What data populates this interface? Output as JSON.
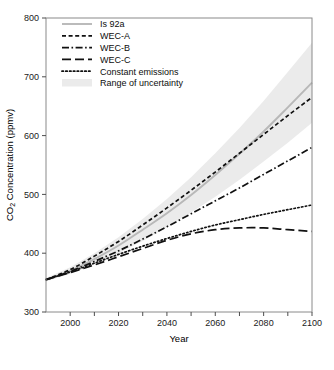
{
  "chart_data": {
    "type": "line",
    "title": "",
    "xlabel": "Year",
    "ylabel": "CO2 Concentration (ppmv)",
    "ylabel_prefix": "CO",
    "ylabel_sub": "2",
    "ylabel_suffix": " Concentration (ppmv)",
    "xlim": [
      1990,
      2100
    ],
    "ylim": [
      300,
      800
    ],
    "xticks": [
      2000,
      2010,
      2020,
      2030,
      2040,
      2050,
      2060,
      2070,
      2080,
      2090,
      2100
    ],
    "xtick_labels": [
      "2000",
      "",
      "2020",
      "",
      "2040",
      "",
      "2060",
      "",
      "2080",
      "",
      "2100"
    ],
    "yticks": [
      300,
      400,
      500,
      600,
      700,
      800
    ],
    "ytick_labels": [
      "300",
      "400",
      "500",
      "600",
      "700",
      "800"
    ],
    "grid": false,
    "legend_position": "top-left",
    "x": [
      1990,
      2000,
      2010,
      2020,
      2030,
      2040,
      2050,
      2060,
      2070,
      2080,
      2090,
      2100
    ],
    "series": [
      {
        "name": "Is 92a",
        "style": "solid",
        "color": "#b8b8b8",
        "values": [
          355,
          370,
          390,
          413,
          440,
          468,
          499,
          533,
          569,
          607,
          648,
          690
        ]
      },
      {
        "name": "WEC-A",
        "style": "short-dash",
        "color": "#111111",
        "values": [
          355,
          372,
          395,
          420,
          448,
          477,
          507,
          538,
          570,
          602,
          634,
          665
        ]
      },
      {
        "name": "WEC-B",
        "style": "dash-dot",
        "color": "#111111",
        "values": [
          355,
          369,
          386,
          404,
          424,
          445,
          467,
          489,
          511,
          534,
          557,
          580
        ]
      },
      {
        "name": "WEC-C",
        "style": "long-dash",
        "color": "#111111",
        "values": [
          355,
          367,
          380,
          394,
          408,
          422,
          433,
          440,
          443,
          443,
          440,
          437
        ]
      },
      {
        "name": "Constant emissions",
        "style": "dotted",
        "color": "#111111",
        "values": [
          355,
          368,
          383,
          398,
          412,
          425,
          437,
          448,
          457,
          466,
          474,
          482
        ]
      }
    ],
    "band": {
      "name": "Range of uncertainty",
      "color": "#ebebeb",
      "upper": [
        358,
        376,
        400,
        427,
        458,
        492,
        529,
        570,
        613,
        659,
        708,
        758
      ],
      "lower": [
        352,
        365,
        381,
        400,
        421,
        444,
        469,
        496,
        525,
        556,
        588,
        622
      ]
    },
    "annotations": []
  },
  "legend": {
    "items": [
      {
        "label": "Is 92a",
        "swatch": "solid-gray"
      },
      {
        "label": "WEC-A",
        "swatch": "short-dash"
      },
      {
        "label": "WEC-B",
        "swatch": "dash-dot"
      },
      {
        "label": "WEC-C",
        "swatch": "long-dash"
      },
      {
        "label": "Constant emissions",
        "swatch": "dotted"
      },
      {
        "label": "Range of uncertainty",
        "swatch": "band"
      }
    ]
  }
}
